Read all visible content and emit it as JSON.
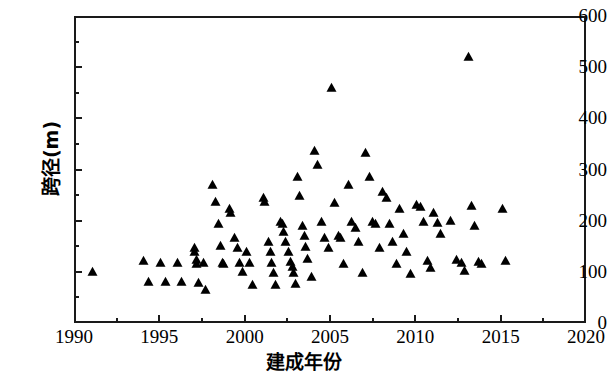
{
  "chart_data": {
    "type": "scatter",
    "title": "",
    "xlabel": "建成年份",
    "ylabel": "跨径(m)",
    "xlim": [
      1990,
      2020
    ],
    "ylim": [
      0,
      600
    ],
    "xticks": [
      1990,
      1995,
      2000,
      2005,
      2010,
      2015,
      2020
    ],
    "xtick_labels": [
      "1990",
      "1995",
      "2000",
      "2005",
      "2010",
      "2015",
      "2020"
    ],
    "x_minor_tick_step": 2.5,
    "yticks": [
      0,
      100,
      200,
      300,
      400,
      500,
      600
    ],
    "ytick_labels": [
      "0",
      "100",
      "200",
      "300",
      "400",
      "500",
      "600"
    ],
    "y_minor_tick_step": 50,
    "grid": false,
    "legend": null,
    "marker": "triangle-up",
    "marker_color": "#000000",
    "series": [
      {
        "name": "桥梁跨径",
        "points": [
          [
            1991.0,
            101
          ],
          [
            1994.0,
            124
          ],
          [
            1994.3,
            83
          ],
          [
            1995.0,
            120
          ],
          [
            1995.3,
            83
          ],
          [
            1996.0,
            120
          ],
          [
            1996.2,
            83
          ],
          [
            1997.0,
            148
          ],
          [
            1997.0,
            140
          ],
          [
            1997.1,
            126
          ],
          [
            1997.1,
            118
          ],
          [
            1997.2,
            80
          ],
          [
            1997.5,
            120
          ],
          [
            1997.6,
            66
          ],
          [
            1998.0,
            272
          ],
          [
            1998.2,
            238
          ],
          [
            1998.4,
            196
          ],
          [
            1998.5,
            152
          ],
          [
            1998.6,
            120
          ],
          [
            1998.7,
            118
          ],
          [
            1999.0,
            224
          ],
          [
            1999.1,
            216
          ],
          [
            1999.3,
            168
          ],
          [
            1999.5,
            148
          ],
          [
            1999.6,
            120
          ],
          [
            1999.8,
            101
          ],
          [
            2000.0,
            140
          ],
          [
            2000.2,
            120
          ],
          [
            2000.4,
            76
          ],
          [
            2001.0,
            246
          ],
          [
            2001.1,
            238
          ],
          [
            2001.3,
            160
          ],
          [
            2001.4,
            140
          ],
          [
            2001.5,
            120
          ],
          [
            2001.6,
            100
          ],
          [
            2001.7,
            76
          ],
          [
            2002.0,
            200
          ],
          [
            2002.1,
            196
          ],
          [
            2002.2,
            180
          ],
          [
            2002.3,
            160
          ],
          [
            2002.5,
            140
          ],
          [
            2002.6,
            122
          ],
          [
            2002.7,
            112
          ],
          [
            2002.8,
            100
          ],
          [
            2002.9,
            78
          ],
          [
            2003.0,
            288
          ],
          [
            2003.1,
            250
          ],
          [
            2003.3,
            192
          ],
          [
            2003.4,
            172
          ],
          [
            2003.5,
            150
          ],
          [
            2003.6,
            128
          ],
          [
            2003.8,
            92
          ],
          [
            2004.0,
            338
          ],
          [
            2004.2,
            310
          ],
          [
            2004.4,
            200
          ],
          [
            2004.6,
            168
          ],
          [
            2004.8,
            148
          ],
          [
            2005.0,
            462
          ],
          [
            2005.2,
            236
          ],
          [
            2005.4,
            172
          ],
          [
            2005.5,
            168
          ],
          [
            2005.7,
            118
          ],
          [
            2006.0,
            272
          ],
          [
            2006.2,
            200
          ],
          [
            2006.4,
            188
          ],
          [
            2006.6,
            160
          ],
          [
            2006.8,
            100
          ],
          [
            2007.0,
            334
          ],
          [
            2007.2,
            288
          ],
          [
            2007.4,
            200
          ],
          [
            2007.6,
            196
          ],
          [
            2007.8,
            148
          ],
          [
            2008.0,
            258
          ],
          [
            2008.2,
            246
          ],
          [
            2008.4,
            196
          ],
          [
            2008.6,
            160
          ],
          [
            2008.8,
            118
          ],
          [
            2009.0,
            224
          ],
          [
            2009.2,
            176
          ],
          [
            2009.4,
            140
          ],
          [
            2009.6,
            98
          ],
          [
            2010.0,
            232
          ],
          [
            2010.2,
            228
          ],
          [
            2010.4,
            200
          ],
          [
            2010.6,
            124
          ],
          [
            2010.8,
            110
          ],
          [
            2011.0,
            216
          ],
          [
            2011.2,
            198
          ],
          [
            2011.4,
            176
          ],
          [
            2012.0,
            202
          ],
          [
            2012.3,
            126
          ],
          [
            2012.6,
            120
          ],
          [
            2012.8,
            104
          ],
          [
            2013.0,
            522
          ],
          [
            2013.2,
            230
          ],
          [
            2013.4,
            192
          ],
          [
            2013.6,
            122
          ],
          [
            2013.8,
            118
          ],
          [
            2015.0,
            224
          ],
          [
            2015.2,
            124
          ]
        ]
      }
    ]
  }
}
